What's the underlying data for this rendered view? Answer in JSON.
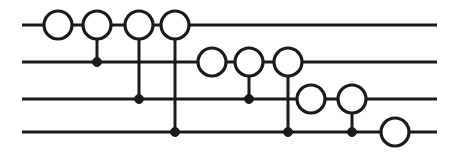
{
  "diagram": {
    "type": "quantum-circuit",
    "canvas": {
      "width": 458,
      "height": 158
    },
    "colors": {
      "background": "#ffffff",
      "ink": "#1a1a1a",
      "gate_fill": "#ffffff"
    },
    "style": {
      "wire_stroke_width": 3.2,
      "connector_stroke_width": 3.0,
      "gate_circle_radius": 14,
      "control_dot_radius": 4.5
    }
  },
  "wires": [
    {
      "id": "wire-1",
      "index": 1,
      "y": 25,
      "x_start": 22,
      "x_end": 437
    },
    {
      "id": "wire-2",
      "index": 2,
      "y": 62,
      "x_start": 22,
      "x_end": 437
    },
    {
      "id": "wire-3",
      "index": 3,
      "y": 99,
      "x_start": 22,
      "x_end": 437
    },
    {
      "id": "wire-4",
      "index": 4,
      "y": 132,
      "x_start": 22,
      "x_end": 437
    }
  ],
  "gates": [
    {
      "id": "gate-w1-1",
      "shape": "open-circle",
      "wire": 1,
      "cx": 58,
      "cy": 25,
      "r": 14
    },
    {
      "id": "gate-w1-2",
      "shape": "open-circle",
      "wire": 1,
      "cx": 97,
      "cy": 25,
      "r": 14
    },
    {
      "id": "gate-w1-3",
      "shape": "open-circle",
      "wire": 1,
      "cx": 139,
      "cy": 25,
      "r": 14
    },
    {
      "id": "gate-w1-4",
      "shape": "open-circle",
      "wire": 1,
      "cx": 175,
      "cy": 25,
      "r": 14
    },
    {
      "id": "gate-w2-1",
      "shape": "open-circle",
      "wire": 2,
      "cx": 212,
      "cy": 62,
      "r": 14
    },
    {
      "id": "gate-w2-2",
      "shape": "open-circle",
      "wire": 2,
      "cx": 249,
      "cy": 62,
      "r": 14
    },
    {
      "id": "gate-w2-3",
      "shape": "open-circle",
      "wire": 2,
      "cx": 288,
      "cy": 62,
      "r": 14
    },
    {
      "id": "gate-w3-1",
      "shape": "open-circle",
      "wire": 3,
      "cx": 311,
      "cy": 99,
      "r": 14
    },
    {
      "id": "gate-w3-2",
      "shape": "open-circle",
      "wire": 3,
      "cx": 352,
      "cy": 99,
      "r": 14
    },
    {
      "id": "gate-w4-1",
      "shape": "open-circle",
      "wire": 4,
      "cx": 395,
      "cy": 132,
      "r": 14
    }
  ],
  "controls": [
    {
      "id": "control-w2-1",
      "shape": "filled-dot",
      "wire": 2,
      "cx": 97,
      "cy": 62,
      "r": 4.5
    },
    {
      "id": "control-w3-1",
      "shape": "filled-dot",
      "wire": 3,
      "cx": 139,
      "cy": 99,
      "r": 4.5
    },
    {
      "id": "control-w4-1",
      "shape": "filled-dot",
      "wire": 4,
      "cx": 175,
      "cy": 132,
      "r": 4.5
    },
    {
      "id": "control-w3-2",
      "shape": "filled-dot",
      "wire": 3,
      "cx": 249,
      "cy": 99,
      "r": 4.5
    },
    {
      "id": "control-w4-2",
      "shape": "filled-dot",
      "wire": 4,
      "cx": 288,
      "cy": 132,
      "r": 4.5
    },
    {
      "id": "control-w4-3",
      "shape": "filled-dot",
      "wire": 4,
      "cx": 352,
      "cy": 132,
      "r": 4.5
    }
  ],
  "connectors": [
    {
      "id": "connector-1",
      "x": 97,
      "y1": 25,
      "y2": 62,
      "from_wire": 1,
      "to_wire": 2
    },
    {
      "id": "connector-2",
      "x": 139,
      "y1": 25,
      "y2": 99,
      "from_wire": 1,
      "to_wire": 3
    },
    {
      "id": "connector-3",
      "x": 175,
      "y1": 25,
      "y2": 132,
      "from_wire": 1,
      "to_wire": 4
    },
    {
      "id": "connector-4",
      "x": 249,
      "y1": 62,
      "y2": 99,
      "from_wire": 2,
      "to_wire": 3
    },
    {
      "id": "connector-5",
      "x": 288,
      "y1": 62,
      "y2": 132,
      "from_wire": 2,
      "to_wire": 4
    },
    {
      "id": "connector-6",
      "x": 352,
      "y1": 99,
      "y2": 132,
      "from_wire": 3,
      "to_wire": 4
    }
  ]
}
